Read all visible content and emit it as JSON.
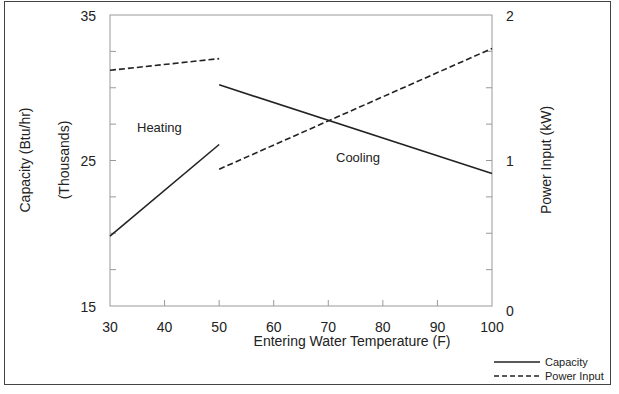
{
  "chart_data": {
    "type": "line",
    "title": "",
    "xlabel": "Entering Water Temperature (F)",
    "ylabel_left": "Capacity (Btu/hr)",
    "ylabel_left_sub": "(Thousands)",
    "ylabel_right": "Power Input (kW)",
    "xlim": [
      30,
      100
    ],
    "ylim_left": [
      15,
      35
    ],
    "ylim_right": [
      0,
      2
    ],
    "x_ticks": [
      30,
      40,
      50,
      60,
      70,
      80,
      90,
      100
    ],
    "y_left_tick_labels": [
      15,
      25,
      35
    ],
    "y_left_minor_ticks": [
      17.5,
      20,
      22.5,
      27.5,
      30,
      32.5
    ],
    "y_right_tick_labels": [
      0,
      1,
      2
    ],
    "y_right_minor_ticks": [
      0.25,
      0.5,
      0.75,
      1.25,
      1.5,
      1.75
    ],
    "grid": false,
    "legend_position": "bottom-right outside plot",
    "annotations": [
      {
        "text": "Heating",
        "x": 38,
        "y": 27.9
      },
      {
        "text": "Cooling",
        "x": 72,
        "y": 25.2
      }
    ],
    "series": [
      {
        "name": "Capacity",
        "mode": "Heating",
        "axis": "left",
        "style": "solid",
        "x": [
          30,
          50
        ],
        "y": [
          19.8,
          26.1
        ]
      },
      {
        "name": "Power Input",
        "mode": "Heating",
        "axis": "right",
        "style": "dashed",
        "x": [
          30,
          50
        ],
        "y": [
          1.62,
          1.7
        ]
      },
      {
        "name": "Capacity",
        "mode": "Cooling",
        "axis": "left",
        "style": "solid",
        "x": [
          50,
          100
        ],
        "y": [
          30.2,
          24.1
        ]
      },
      {
        "name": "Power Input",
        "mode": "Cooling",
        "axis": "right",
        "style": "dashed",
        "x": [
          50,
          100
        ],
        "y": [
          0.94,
          1.77
        ]
      }
    ],
    "legend": [
      {
        "label": "Capacity",
        "style": "solid"
      },
      {
        "label": "Power Input",
        "style": "dashed"
      }
    ]
  },
  "labels": {
    "xlabel": "Entering Water Temperature (F)",
    "ylabel_left": "Capacity (Btu/hr)",
    "ylabel_left_sub": "(Thousands)",
    "ylabel_right": "Power Input (kW)",
    "heating": "Heating",
    "cooling": "Cooling",
    "legend_capacity": "Capacity",
    "legend_power": "Power Input",
    "x_ticks": [
      "30",
      "40",
      "50",
      "60",
      "70",
      "80",
      "90",
      "100"
    ],
    "y_left": [
      "35",
      "25",
      "15"
    ],
    "y_right": [
      "2",
      "1",
      "0"
    ]
  }
}
